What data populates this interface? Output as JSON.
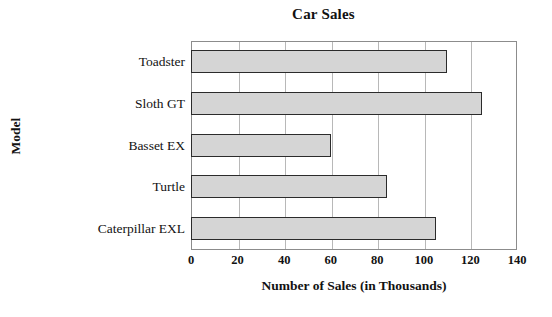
{
  "chart_data": {
    "type": "bar",
    "orientation": "horizontal",
    "title": "Car Sales",
    "xlabel": "Number of Sales (in Thousands)",
    "ylabel": "Model",
    "categories": [
      "Toadster",
      "Sloth GT",
      "Basset EX",
      "Turtle",
      "Caterpillar EXL"
    ],
    "values": [
      110,
      125,
      60,
      84,
      105
    ],
    "xlim": [
      0,
      140
    ],
    "xticks": [
      0,
      20,
      40,
      60,
      80,
      100,
      120,
      140
    ],
    "xtick_labels": [
      "0",
      "20",
      "40",
      "60",
      "80",
      "100",
      "120",
      "140"
    ],
    "grid": "vertical",
    "legend": "none",
    "bar_fill_color": "#d5d5d5",
    "bar_border_color": "#2b2b2b",
    "plot_border_color": "#8c8c8c",
    "gridline_color": "#b8b8b8",
    "background_color": "#ffffff"
  }
}
